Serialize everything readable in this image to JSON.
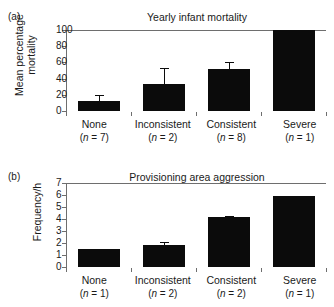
{
  "figure": {
    "panels": [
      {
        "letter": "(a)",
        "title": "Yearly infant mortality",
        "ylabel": "Mean percentage\nmortality"
      },
      {
        "letter": "(b)",
        "title": "Provisioning area aggression",
        "ylabel": "Frequency/h"
      }
    ]
  },
  "chart_data": [
    {
      "type": "bar",
      "panel": "(a)",
      "title": "Yearly infant mortality",
      "xlabel": "",
      "ylabel": "Mean percentage mortality",
      "categories": [
        "None",
        "Inconsistent",
        "Consistent",
        "Severe"
      ],
      "category_n": [
        "(n = 7)",
        "(n = 2)",
        "(n = 8)",
        "(n = 1)"
      ],
      "n_values": [
        7,
        2,
        8,
        1
      ],
      "values": [
        12,
        33,
        52,
        100
      ],
      "errors": [
        8,
        20,
        8,
        0
      ],
      "ylim": [
        0,
        100
      ],
      "yticks": [
        0,
        20,
        40,
        60,
        80,
        100
      ],
      "ytick_labels": [
        "0",
        "20",
        "40",
        "60",
        "80",
        "100"
      ],
      "grid": false,
      "legend": "none",
      "bar_color": "#0b0b0b"
    },
    {
      "type": "bar",
      "panel": "(b)",
      "title": "Provisioning area aggression",
      "xlabel": "",
      "ylabel": "Frequency/h",
      "categories": [
        "None",
        "Inconsistent",
        "Consistent",
        "Severe"
      ],
      "category_n": [
        "(n = 1)",
        "(n = 2)",
        "(n = 2)",
        "(n = 1)"
      ],
      "n_values": [
        1,
        2,
        2,
        1
      ],
      "values": [
        1.5,
        1.85,
        4.15,
        5.9
      ],
      "errors": [
        0,
        0.25,
        0.08,
        0
      ],
      "ylim": [
        0,
        7
      ],
      "yticks": [
        0,
        1,
        2,
        3,
        4,
        5,
        6,
        7
      ],
      "ytick_labels": [
        "0",
        "1",
        "2",
        "3",
        "4",
        "5",
        "6",
        "7"
      ],
      "grid": false,
      "legend": "none",
      "bar_color": "#0b0b0b"
    }
  ]
}
